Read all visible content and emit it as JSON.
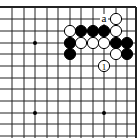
{
  "board": {
    "cols_x": [
      12,
      24,
      35,
      47,
      58,
      70,
      81,
      93,
      104,
      116,
      127,
      136
    ],
    "rows_y": [
      7,
      19,
      31,
      43,
      54,
      66,
      78,
      89,
      101,
      113,
      124,
      136
    ],
    "top_edge": true,
    "right_edge": true,
    "star_points": [
      [
        35,
        43
      ],
      [
        35,
        113
      ],
      [
        104,
        113
      ]
    ],
    "stones": [
      {
        "color": "white",
        "x": 116,
        "y": 19
      },
      {
        "color": "white",
        "x": 70,
        "y": 31
      },
      {
        "color": "black",
        "x": 81,
        "y": 31
      },
      {
        "color": "black",
        "x": 93,
        "y": 31
      },
      {
        "color": "black",
        "x": 104,
        "y": 31
      },
      {
        "color": "white",
        "x": 116,
        "y": 31
      },
      {
        "color": "black",
        "x": 70,
        "y": 43
      },
      {
        "color": "white",
        "x": 81,
        "y": 43
      },
      {
        "color": "white",
        "x": 93,
        "y": 43
      },
      {
        "color": "white",
        "x": 104,
        "y": 43
      },
      {
        "color": "black",
        "x": 116,
        "y": 43
      },
      {
        "color": "black",
        "x": 127,
        "y": 43
      },
      {
        "color": "black",
        "x": 70,
        "y": 54
      },
      {
        "color": "white",
        "x": 116,
        "y": 54
      },
      {
        "color": "black",
        "x": 127,
        "y": 54
      },
      {
        "color": "white",
        "x": 104,
        "y": 66,
        "label": "1"
      }
    ],
    "annotations": [
      {
        "text": "a",
        "x": 104,
        "y": 19
      }
    ]
  }
}
